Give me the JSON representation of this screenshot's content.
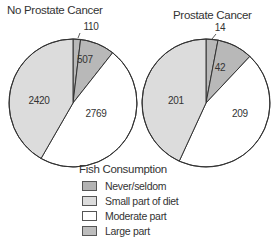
{
  "chart_data": [
    {
      "type": "pie",
      "title": "No Prostate Cancer",
      "categories": [
        "Never/seldom",
        "Large part",
        "Moderate part",
        "Small part of diet"
      ],
      "values": [
        110,
        507,
        2769,
        2420
      ],
      "colors": [
        "#b8b8b8",
        "#b8b8b8",
        "#ffffff",
        "#dcdcdc"
      ],
      "start_angle": "12 o'clock",
      "direction": "clockwise"
    },
    {
      "type": "pie",
      "title": "Prostate Cancer",
      "categories": [
        "Never/seldom",
        "Large part",
        "Moderate part",
        "Small part of diet"
      ],
      "values": [
        14,
        42,
        209,
        201
      ],
      "colors": [
        "#b8b8b8",
        "#b8b8b8",
        "#ffffff",
        "#dcdcdc"
      ],
      "start_angle": "12 o'clock",
      "direction": "clockwise"
    }
  ],
  "legend": {
    "title": "Fish Consumption",
    "items": [
      {
        "label": "Never/seldom",
        "color": "#b3b3b3"
      },
      {
        "label": "Small part of diet",
        "color": "#dcdcdc"
      },
      {
        "label": "Moderate part",
        "color": "#ffffff"
      },
      {
        "label": "Large part",
        "color": "#bdbdbd"
      }
    ]
  },
  "titles": {
    "left": "No Prostate Cancer",
    "right": "Prostate Cancer"
  }
}
